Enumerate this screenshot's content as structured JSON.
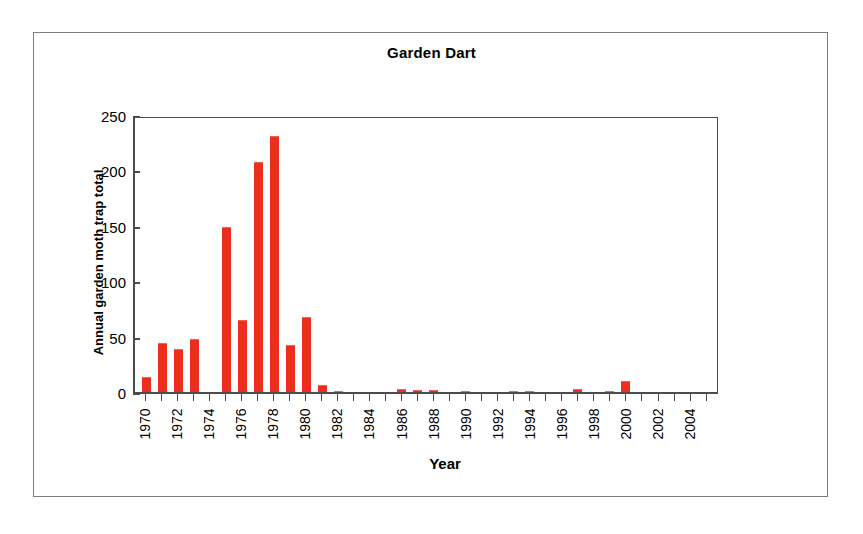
{
  "chart_data": {
    "type": "bar",
    "title": "Garden Dart",
    "xlabel": "Year",
    "ylabel": "Annual garden moth trap total",
    "ylim": [
      0,
      250
    ],
    "yticks": [
      0,
      50,
      100,
      150,
      200,
      250
    ],
    "grid": false,
    "legend": null,
    "bar_color": "#ee2d1d",
    "categories": [
      "1970",
      "1971",
      "1972",
      "1973",
      "1974",
      "1975",
      "1976",
      "1977",
      "1978",
      "1979",
      "1980",
      "1981",
      "1982",
      "1983",
      "1984",
      "1985",
      "1986",
      "1987",
      "1988",
      "1989",
      "1990",
      "1991",
      "1992",
      "1993",
      "1994",
      "1995",
      "1996",
      "1997",
      "1998",
      "1999",
      "2000",
      "2001",
      "2002",
      "2003",
      "2004",
      "2005"
    ],
    "values": [
      14,
      44,
      39,
      48,
      0,
      149,
      65,
      208,
      231,
      42,
      68,
      6,
      1,
      0,
      0,
      0,
      3,
      2,
      2,
      0,
      1,
      0,
      0,
      1,
      1,
      0,
      0,
      3,
      0,
      1,
      10,
      0,
      0,
      0,
      0,
      0
    ],
    "tick_labels": [
      "1970",
      "",
      "1972",
      "",
      "1974",
      "",
      "1976",
      "",
      "1978",
      "",
      "1980",
      "",
      "1982",
      "",
      "1984",
      "",
      "1986",
      "",
      "1988",
      "",
      "1990",
      "",
      "1992",
      "",
      "1994",
      "",
      "1996",
      "",
      "1998",
      "",
      "2000",
      "",
      "2002",
      "",
      "2004",
      ""
    ]
  }
}
